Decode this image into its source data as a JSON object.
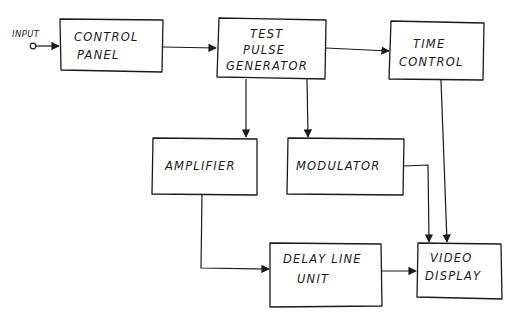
{
  "diagram": {
    "type": "block-diagram",
    "style": "hand-drawn",
    "input": {
      "label": "INPUT"
    },
    "blocks": {
      "control_panel": {
        "lines": [
          "CONTROL",
          "PANEL"
        ]
      },
      "test_pulse_generator": {
        "lines": [
          "TEST",
          "PULSE",
          "GENERATOR"
        ]
      },
      "time_control": {
        "lines": [
          "TIME",
          "CONTROL"
        ]
      },
      "amplifier": {
        "lines": [
          "AMPLIFIER"
        ]
      },
      "modulator": {
        "lines": [
          "MODULATOR"
        ]
      },
      "delay_line_unit": {
        "lines": [
          "DELAY LINE",
          "UNIT"
        ]
      },
      "video_display": {
        "lines": [
          "VIDEO",
          "DISPLAY"
        ]
      }
    },
    "connections": [
      {
        "from": "INPUT",
        "to": "CONTROL PANEL"
      },
      {
        "from": "CONTROL PANEL",
        "to": "TEST PULSE GENERATOR"
      },
      {
        "from": "TEST PULSE GENERATOR",
        "to": "TIME CONTROL"
      },
      {
        "from": "TEST PULSE GENERATOR",
        "to": "AMPLIFIER"
      },
      {
        "from": "TEST PULSE GENERATOR",
        "to": "MODULATOR"
      },
      {
        "from": "AMPLIFIER",
        "to": "DELAY LINE UNIT"
      },
      {
        "from": "DELAY LINE UNIT",
        "to": "VIDEO DISPLAY"
      },
      {
        "from": "MODULATOR",
        "to": "VIDEO DISPLAY"
      },
      {
        "from": "TIME CONTROL",
        "to": "VIDEO DISPLAY"
      }
    ],
    "colors": {
      "ink": "#1a1a1a",
      "paper": "#ffffff"
    }
  }
}
